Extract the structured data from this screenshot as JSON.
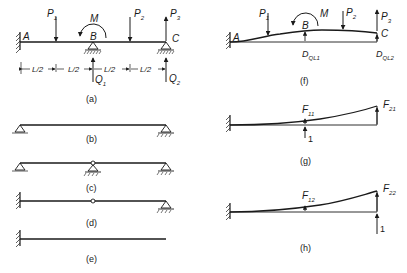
{
  "figure": {
    "panels": {
      "a": {
        "caption": "(a)",
        "points": [
          "A",
          "B",
          "C"
        ],
        "loads": [
          "P1",
          "P2",
          "P3",
          "M"
        ],
        "reactions": [
          "Q1",
          "Q2"
        ],
        "spans": [
          "L/2",
          "L/2",
          "L/2",
          "L/2"
        ]
      },
      "b": {
        "caption": "(b)"
      },
      "c": {
        "caption": "(c)"
      },
      "d": {
        "caption": "(d)"
      },
      "e": {
        "caption": "(e)"
      },
      "f": {
        "caption": "(f)",
        "points": [
          "A",
          "B",
          "C"
        ],
        "loads": [
          "P1",
          "P2",
          "P3",
          "M"
        ],
        "displacements": [
          "DQL1",
          "DQL2"
        ]
      },
      "g": {
        "caption": "(g)",
        "labels": [
          "F11",
          "F21"
        ],
        "unit_load": "1"
      },
      "h": {
        "caption": "(h)",
        "labels": [
          "F12",
          "F22"
        ],
        "unit_load": "1"
      }
    }
  },
  "labels": {
    "A": "A",
    "B": "B",
    "C": "C",
    "M": "M",
    "P": "P",
    "Q": "Q",
    "F": "F",
    "D": "D",
    "one": "1",
    "half": "L/2",
    "sub1": "1",
    "sub2": "2",
    "sub3": "3",
    "sub11": "11",
    "sub21": "21",
    "sub12": "12",
    "sub22": "22",
    "subQL1": "QL1",
    "subQL2": "QL2"
  },
  "captions": {
    "a": "(a)",
    "b": "(b)",
    "c": "(c)",
    "d": "(d)",
    "e": "(e)",
    "f": "(f)",
    "g": "(g)",
    "h": "(h)"
  }
}
